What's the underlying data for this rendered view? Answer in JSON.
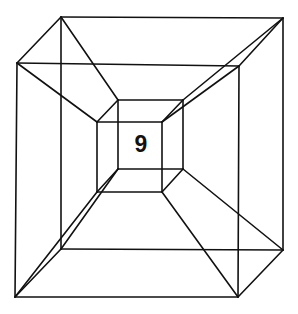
{
  "diagram": {
    "title": "",
    "label": "9",
    "stroke_color": "#111111",
    "background": "#ffffff",
    "vertices": {
      "outer_back_tl": [
        61,
        17
      ],
      "outer_back_tr": [
        283,
        18
      ],
      "outer_back_br": [
        283,
        250
      ],
      "outer_back_bl": [
        61,
        249
      ],
      "outer_front_tl": [
        17,
        63
      ],
      "outer_front_tr": [
        239,
        66
      ],
      "outer_front_br": [
        238,
        297
      ],
      "outer_front_bl": [
        15,
        297
      ],
      "inner_back_tl": [
        118,
        100
      ],
      "inner_back_tr": [
        183,
        100
      ],
      "inner_back_br": [
        183,
        169
      ],
      "inner_back_bl": [
        118,
        169
      ],
      "inner_front_tl": [
        97,
        122
      ],
      "inner_front_tr": [
        162,
        122
      ],
      "inner_front_br": [
        162,
        192
      ],
      "inner_front_bl": [
        97,
        192
      ]
    },
    "edges": [
      [
        "outer_back_tl",
        "outer_back_tr"
      ],
      [
        "outer_back_tr",
        "outer_back_br"
      ],
      [
        "outer_back_br",
        "outer_back_bl"
      ],
      [
        "outer_back_bl",
        "outer_back_tl"
      ],
      [
        "outer_front_tl",
        "outer_front_tr"
      ],
      [
        "outer_front_tr",
        "outer_front_br"
      ],
      [
        "outer_front_br",
        "outer_front_bl"
      ],
      [
        "outer_front_bl",
        "outer_front_tl"
      ],
      [
        "outer_back_tl",
        "outer_front_tl"
      ],
      [
        "outer_back_tr",
        "outer_front_tr"
      ],
      [
        "outer_back_br",
        "outer_front_br"
      ],
      [
        "outer_back_bl",
        "outer_front_bl"
      ],
      [
        "inner_back_tl",
        "inner_back_tr"
      ],
      [
        "inner_back_tr",
        "inner_back_br"
      ],
      [
        "inner_back_br",
        "inner_back_bl"
      ],
      [
        "inner_back_bl",
        "inner_back_tl"
      ],
      [
        "inner_front_tl",
        "inner_front_tr"
      ],
      [
        "inner_front_tr",
        "inner_front_br"
      ],
      [
        "inner_front_br",
        "inner_front_bl"
      ],
      [
        "inner_front_bl",
        "inner_front_tl"
      ],
      [
        "inner_back_tl",
        "inner_front_tl"
      ],
      [
        "inner_back_tr",
        "inner_front_tr"
      ],
      [
        "inner_back_br",
        "inner_front_br"
      ],
      [
        "inner_back_bl",
        "inner_front_bl"
      ],
      [
        "outer_back_tl",
        "inner_back_tl"
      ],
      [
        "outer_back_tr",
        "inner_back_tr"
      ],
      [
        "outer_back_br",
        "inner_back_br"
      ],
      [
        "outer_back_bl",
        "inner_back_bl"
      ],
      [
        "outer_front_tl",
        "inner_front_tl"
      ],
      [
        "outer_front_tr",
        "inner_front_tr"
      ],
      [
        "outer_front_br",
        "inner_front_br"
      ],
      [
        "outer_front_bl",
        "inner_front_bl"
      ]
    ],
    "label_position": [
      141,
      152
    ]
  }
}
